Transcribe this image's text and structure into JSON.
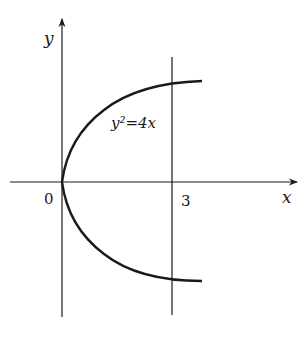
{
  "diagram": {
    "equation_label": "y²=4x",
    "x_axis_label": "x",
    "y_axis_label": "y",
    "origin_label": "0",
    "vertical_line_label": "3",
    "vertical_line_x": 3,
    "curve": "y^2 = 4x",
    "stroke_color": "#1a1a1a",
    "background_color": "#ffffff"
  }
}
